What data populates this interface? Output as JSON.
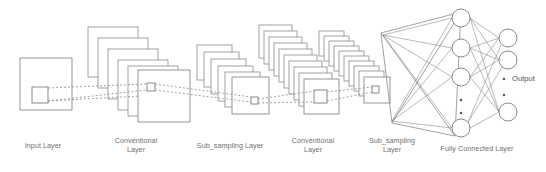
{
  "figure": {
    "type": "cnn-architecture-diagram",
    "background_color": "#ffffff",
    "stroke_color": "#8a8a8a",
    "text_color": "#6f6f6f",
    "width": 546,
    "height": 172
  },
  "labels": {
    "input_layer": "Input Layer",
    "conv_layer_1": "Conventional\nLayer",
    "subsampling_layer_1": "Sub_sampling Layer",
    "conv_layer_2": "Conventional\nLayer",
    "subsampling_layer_2": "Sub_sampling\nLayer",
    "fully_connected_layer": "Fully Connected Layer",
    "output": "Output"
  },
  "layers": [
    {
      "id": "input",
      "name": "Input Layer",
      "kind": "single-plane",
      "cards": 1,
      "plane_size": 52,
      "x": 20,
      "y": 58,
      "receptive_field": {
        "x": 32,
        "y": 87,
        "size": 16
      },
      "label_x": 13,
      "label_y": 141
    },
    {
      "id": "conv1",
      "name": "Conventional Layer",
      "kind": "stack",
      "cards": 6,
      "plane_size": 50,
      "x": 88,
      "y": 27,
      "step_x": 10,
      "step_y": 11,
      "receptive_field": {
        "x": 147,
        "y": 83,
        "size": 8
      },
      "label_x": 106,
      "label_y": 136
    },
    {
      "id": "sub1",
      "name": "Sub_sampling Layer",
      "kind": "stack",
      "cards": 6,
      "plane_size": 35,
      "x": 197,
      "y": 45,
      "step_x": 7,
      "step_y": 7.5,
      "receptive_field": {
        "x": 243,
        "y": 90,
        "size": 7
      },
      "label_x": 191,
      "label_y": 141
    },
    {
      "id": "conv2",
      "name": "Conventional Layer",
      "kind": "stack",
      "cards": 10,
      "plane_size": 33,
      "x": 259,
      "y": 25,
      "step_x": 5.5,
      "step_y": 6.5,
      "receptive_field": {
        "x": 332,
        "y": 96,
        "size": 7
      },
      "label_x": 283,
      "label_y": 136
    },
    {
      "id": "sub2",
      "name": "Sub_sampling Layer",
      "kind": "stack",
      "cards": 10,
      "plane_size": 25,
      "x": 319,
      "y": 31,
      "step_x": 4.5,
      "step_y": 5.5,
      "receptive_field": {
        "x": 372,
        "y": 92,
        "size": 6
      },
      "label_x": 363,
      "label_y": 136
    },
    {
      "id": "fc",
      "name": "Fully Connected Layer",
      "kind": "node-columns",
      "label_x": 429,
      "label_y": 144
    }
  ],
  "fc_network": {
    "hidden_nodes": [
      {
        "cx": 461,
        "cy": 18,
        "r": 9
      },
      {
        "cx": 461,
        "cy": 48,
        "r": 9
      },
      {
        "cx": 461,
        "cy": 77,
        "r": 9
      },
      {
        "cx": 461,
        "cy": 128,
        "r": 9
      }
    ],
    "hidden_ellipsis": [
      {
        "cx": 461,
        "cy": 100
      },
      {
        "cx": 461,
        "cy": 113
      }
    ],
    "output_nodes": [
      {
        "cx": 508,
        "cy": 38,
        "r": 9
      },
      {
        "cx": 508,
        "cy": 60,
        "r": 9
      },
      {
        "cx": 508,
        "cy": 112,
        "r": 9
      }
    ],
    "output_ellipsis": [
      {
        "cx": 504,
        "cy": 79
      },
      {
        "cx": 504,
        "cy": 95
      }
    ],
    "output_label": {
      "x": 512,
      "y": 75
    }
  },
  "funnel": {
    "apex_top": {
      "x": 381,
      "y": 33
    },
    "apex_bottom": {
      "x": 392,
      "y": 123
    },
    "far_top": {
      "x": 461,
      "y": 12
    },
    "far_bottom": {
      "x": 455,
      "y": 136
    }
  },
  "connectors": {
    "style": "dotted",
    "color": "#8a8a8a"
  }
}
